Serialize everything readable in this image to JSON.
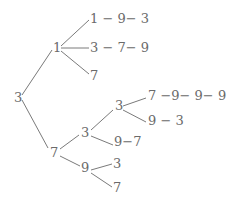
{
  "diagram": {
    "type": "tree",
    "root": {
      "label": "3",
      "children": [
        {
          "label": "1",
          "children": [
            {
              "label": "1 − 9− 3"
            },
            {
              "label": "3 − 7− 9"
            },
            {
              "label": "7"
            }
          ]
        },
        {
          "label": "7",
          "children": [
            {
              "label": "3",
              "children": [
                {
                  "label": "3",
                  "children": [
                    {
                      "label": "7 −9− 9− 9"
                    },
                    {
                      "label": "9 − 3"
                    }
                  ]
                },
                {
                  "label": "9−7"
                }
              ]
            },
            {
              "label": "9",
              "children": [
                {
                  "label": "3"
                },
                {
                  "label": "7"
                }
              ]
            }
          ]
        }
      ]
    }
  },
  "colors": {
    "text": "#6a6a6a",
    "line": "#7a7a7a",
    "background": "#ffffff"
  }
}
